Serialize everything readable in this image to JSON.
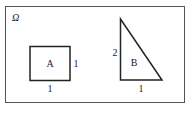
{
  "diagram": {
    "universe_label": "Ω",
    "shapes": [
      {
        "name": "A",
        "type": "square",
        "side_bottom": "1",
        "side_right": "1"
      },
      {
        "name": "B",
        "type": "right-triangle",
        "side_left": "2",
        "side_bottom": "1"
      }
    ],
    "colors": {
      "stroke": "#222222",
      "frame": "#555555",
      "background": "#ffffff"
    }
  }
}
